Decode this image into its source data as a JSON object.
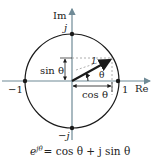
{
  "figure": {
    "axes": {
      "imag_label": "Im",
      "real_label": "Re"
    },
    "points": {
      "top": "j",
      "bottom": "−j",
      "left": "−1",
      "right": "1"
    },
    "vector": {
      "magnitude_label": "1",
      "angle_label": "θ"
    },
    "projections": {
      "vertical_label": "sin θ",
      "horizontal_label": "cos θ"
    },
    "equation": {
      "base": "e",
      "exponent": "jθ",
      "rhs": "= cos θ + j sin θ"
    },
    "colors": {
      "axis": "#6f8a96",
      "stroke": "#1a1a1a",
      "dashed": "#9a9a9a"
    }
  }
}
